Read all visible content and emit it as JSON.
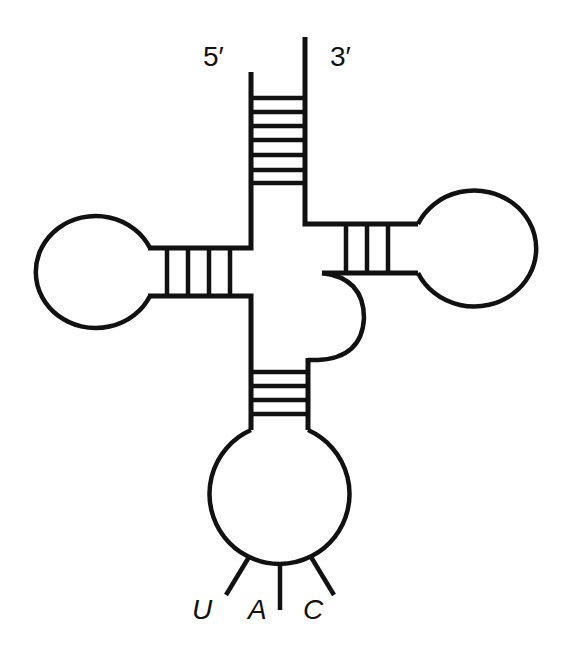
{
  "diagram": {
    "ends": {
      "five_prime": "5′",
      "three_prime": "3′"
    },
    "arms": [
      {
        "name": "acceptor-stem",
        "base_pairs": 7
      },
      {
        "name": "d-arm",
        "base_pairs": 4,
        "has_loop": true
      },
      {
        "name": "anticodon-arm",
        "base_pairs": 4,
        "has_loop": true
      },
      {
        "name": "variable-loop",
        "base_pairs": 0
      },
      {
        "name": "t-arm",
        "base_pairs": 3,
        "has_loop": true
      }
    ],
    "anticodon": {
      "bases": [
        "U",
        "A",
        "C"
      ]
    }
  }
}
